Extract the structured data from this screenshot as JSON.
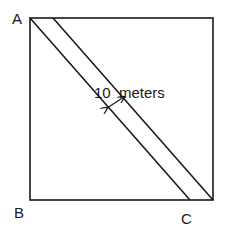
{
  "diagram": {
    "vertices": {
      "A": "A",
      "B": "B",
      "C": "C"
    },
    "path_width_label": "10  meters",
    "colors": {
      "stroke": "#1a1a1a",
      "background": "#ffffff"
    }
  }
}
